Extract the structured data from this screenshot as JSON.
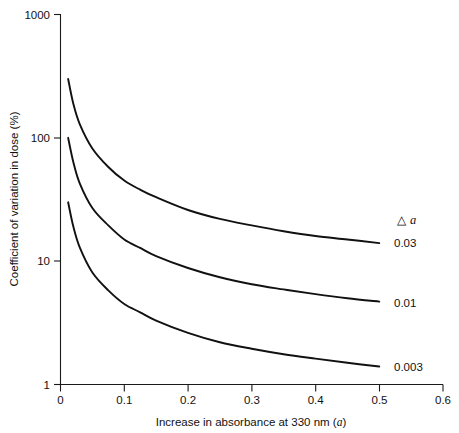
{
  "chart_data": {
    "type": "line",
    "title": "",
    "xlabel": "Increase in absorbance at 330 nm (a)",
    "ylabel": "Coefficient of variation in dose (%)",
    "yscale": "log",
    "xscale": "linear",
    "xlim": [
      0,
      0.6
    ],
    "ylim": [
      1,
      1000
    ],
    "xticks": [
      "0",
      "0.1",
      "0.2",
      "0.3",
      "0.4",
      "0.5",
      "0.6"
    ],
    "xtick_values": [
      0,
      0.1,
      0.2,
      0.3,
      0.4,
      0.5,
      0.6
    ],
    "yticks": [
      "1",
      "10",
      "100",
      "1000"
    ],
    "ytick_values": [
      1,
      10,
      100,
      1000
    ],
    "grid": false,
    "legend_position": "right-of-plot",
    "legend_title_symbol": "△",
    "legend_title_variable": "a",
    "series": [
      {
        "name": "0.03",
        "label": "0.03",
        "x": [
          0.012,
          0.02,
          0.03,
          0.05,
          0.075,
          0.1,
          0.125,
          0.15,
          0.2,
          0.25,
          0.3,
          0.35,
          0.4,
          0.45,
          0.5
        ],
        "values": [
          300,
          190,
          130,
          82,
          58,
          45,
          38,
          33,
          26,
          22,
          19.5,
          17.5,
          16,
          15,
          14
        ]
      },
      {
        "name": "0.01",
        "label": "0.01",
        "x": [
          0.012,
          0.02,
          0.03,
          0.05,
          0.075,
          0.1,
          0.125,
          0.15,
          0.2,
          0.25,
          0.3,
          0.35,
          0.4,
          0.45,
          0.5
        ],
        "values": [
          100,
          64,
          43,
          27,
          19.5,
          15,
          12.8,
          11,
          8.8,
          7.4,
          6.5,
          5.9,
          5.4,
          5.0,
          4.7
        ]
      },
      {
        "name": "0.003",
        "label": "0.003",
        "x": [
          0.012,
          0.02,
          0.03,
          0.05,
          0.075,
          0.1,
          0.125,
          0.15,
          0.2,
          0.25,
          0.3,
          0.35,
          0.4,
          0.45,
          0.5
        ],
        "values": [
          30,
          19.2,
          13,
          8.1,
          5.8,
          4.5,
          3.85,
          3.3,
          2.62,
          2.2,
          1.95,
          1.76,
          1.62,
          1.5,
          1.4
        ]
      }
    ]
  },
  "axes": {
    "x_title_prefix": "Increase in absorbance at 330 nm (",
    "x_title_variable": "a",
    "x_title_suffix": ")",
    "y_title": "Coefficient of variation in dose (%)"
  }
}
